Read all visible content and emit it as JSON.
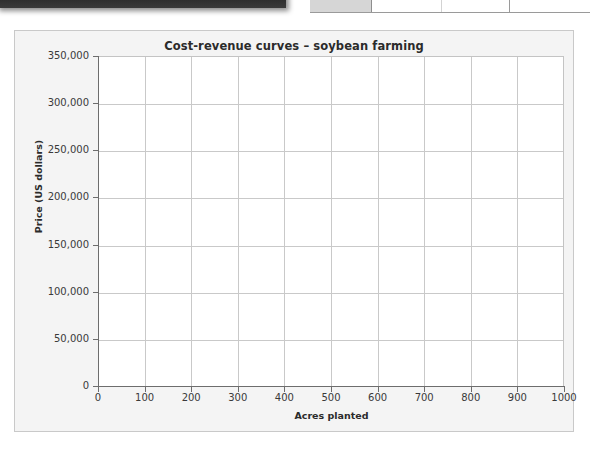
{
  "chrome": {
    "dark_bar_name": "partial-dark-toolbar",
    "table_fragment_name": "partial-table-header-row",
    "table_cells": [
      "",
      "",
      "",
      ""
    ]
  },
  "figure": {
    "title": "Cost-revenue curves – soybean farming"
  },
  "chart_data": {
    "type": "line",
    "title": "Cost-revenue curves – soybean farming",
    "xlabel": "Acres planted",
    "ylabel": "Price (US dollars)",
    "xlim": [
      0,
      1000
    ],
    "ylim": [
      0,
      350000
    ],
    "xticks": [
      0,
      100,
      200,
      300,
      400,
      500,
      600,
      700,
      800,
      900,
      1000
    ],
    "yticks": [
      0,
      50000,
      100000,
      150000,
      200000,
      250000,
      300000,
      350000
    ],
    "xtick_labels": [
      "0",
      "100",
      "200",
      "300",
      "400",
      "500",
      "600",
      "700",
      "800",
      "900",
      "1000"
    ],
    "ytick_labels": [
      "0",
      "50,000",
      "100,000",
      "150,000",
      "200,000",
      "250,000",
      "300,000",
      "350,000"
    ],
    "grid": true,
    "legend": null,
    "series": [],
    "note": "Empty plot grid — no data curves are drawn in the screenshot"
  },
  "colors": {
    "card_background": "#f4f4f4",
    "card_border": "#c9c9c9",
    "plot_background": "#ffffff",
    "grid_line": "#c9c9c9",
    "axis_line": "#6d6d6d",
    "text": "#2b2b2b",
    "tick_text": "#3a3a3a",
    "dark_bar": "#2c2c2c"
  }
}
